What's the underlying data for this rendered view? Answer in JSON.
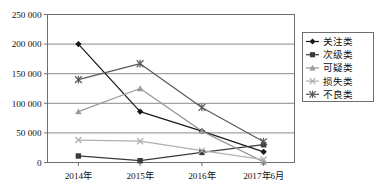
{
  "chart_data": {
    "type": "line",
    "title": "",
    "subtitle": "",
    "xlabel": "",
    "ylabel": "",
    "categories": [
      "2014年",
      "2015年",
      "2016年",
      "2017年6月"
    ],
    "ylim": [
      0,
      250000
    ],
    "yticks": [
      0,
      50000,
      100000,
      150000,
      200000,
      250000
    ],
    "ytick_labels": [
      "0",
      "50 000",
      "100 000",
      "150 000",
      "200 000",
      "250 000"
    ],
    "grid": true,
    "grid_axis": "y",
    "legend_position": "right",
    "series": [
      {
        "name": "关注类",
        "marker": "diamond",
        "color": "#1a1a1a",
        "values": [
          200000,
          86000,
          53000,
          18000
        ]
      },
      {
        "name": "次级类",
        "marker": "square",
        "color": "#3a3a3a",
        "values": [
          11000,
          3000,
          17000,
          30000
        ]
      },
      {
        "name": "可疑类",
        "marker": "triangle",
        "color": "#9a9a9a",
        "values": [
          86000,
          125000,
          53000,
          1000
        ]
      },
      {
        "name": "损失类",
        "marker": "cross",
        "color": "#b0b0b0",
        "values": [
          38000,
          36000,
          20000,
          5000
        ]
      },
      {
        "name": "不良类",
        "marker": "star",
        "color": "#5a5a5a",
        "values": [
          140000,
          167000,
          93000,
          35000
        ]
      }
    ]
  },
  "legend": {
    "items": [
      {
        "label": "关注类"
      },
      {
        "label": "次级类"
      },
      {
        "label": "可疑类"
      },
      {
        "label": "损失类"
      },
      {
        "label": "不良类"
      }
    ]
  },
  "axis": {
    "y_labels": [
      "250 000",
      "200 000",
      "150 000",
      "100 000",
      "50 000",
      "0"
    ],
    "x_labels": [
      "2014年",
      "2015年",
      "2016年",
      "2017年6月"
    ]
  }
}
